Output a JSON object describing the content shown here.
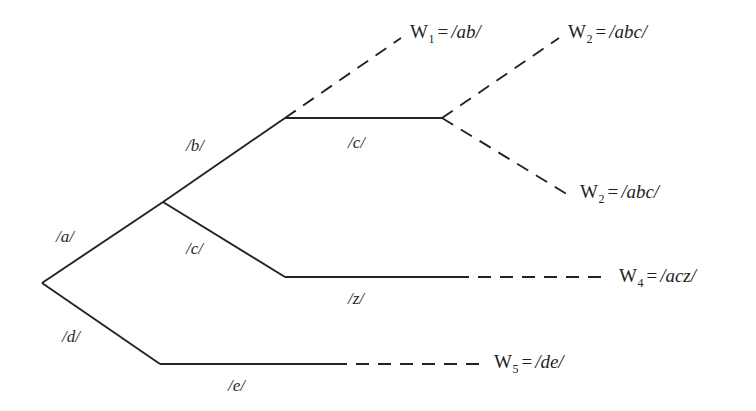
{
  "diagram": {
    "type": "phoneme-branching-tree",
    "background_color": "#ffffff",
    "line_color": "#232323",
    "solid_style": "solid",
    "terminal_style": "dashed",
    "nodes": {
      "root": {
        "x": 42,
        "y": 283
      },
      "upper_branch": {
        "x": 163,
        "y": 202
      },
      "b_node": {
        "x": 285,
        "y": 118
      },
      "c_fork": {
        "x": 442,
        "y": 118
      },
      "z_node": {
        "x": 285,
        "y": 277
      },
      "d_node": {
        "x": 160,
        "y": 364
      }
    },
    "edges": [
      {
        "id": "edge-a",
        "label": "/a/",
        "from": "root",
        "to": "upper_branch",
        "style": "solid"
      },
      {
        "id": "edge-d",
        "label": "/d/",
        "from": "root",
        "to": "d_node",
        "style": "solid"
      },
      {
        "id": "edge-b",
        "label": "/b/",
        "from": "upper_branch",
        "to": "b_node",
        "style": "solid"
      },
      {
        "id": "edge-c-upper",
        "label": "/c/",
        "from": "b_node",
        "to": "c_fork",
        "style": "solid"
      },
      {
        "id": "edge-c-lower",
        "label": "/c/",
        "from": "upper_branch",
        "to": "z_node",
        "style": "solid"
      },
      {
        "id": "edge-z",
        "label": "/z/",
        "from": "z_node",
        "to": "w4",
        "style": "solid-then-dashed"
      },
      {
        "id": "edge-e",
        "label": "/e/",
        "from": "d_node",
        "to": "w5",
        "style": "solid-then-dashed"
      },
      {
        "id": "edge-w1",
        "label": "",
        "from": "b_node",
        "to": "w1",
        "style": "dashed"
      },
      {
        "id": "edge-w2-upper",
        "label": "",
        "from": "c_fork",
        "to": "w2_upper",
        "style": "dashed"
      },
      {
        "id": "edge-w2-lower",
        "label": "",
        "from": "c_fork",
        "to": "w2_lower",
        "style": "dashed"
      }
    ],
    "phoneme_labels": [
      {
        "id": "label-a",
        "text": "/a/",
        "x": 56,
        "y": 228
      },
      {
        "id": "label-b",
        "text": "/b/",
        "x": 186,
        "y": 137
      },
      {
        "id": "label-c-upper",
        "text": "/c/",
        "x": 348,
        "y": 134
      },
      {
        "id": "label-c-lower",
        "text": "/c/",
        "x": 186,
        "y": 240
      },
      {
        "id": "label-z",
        "text": "/z/",
        "x": 348,
        "y": 290
      },
      {
        "id": "label-d",
        "text": "/d/",
        "x": 62,
        "y": 328
      },
      {
        "id": "label-e",
        "text": "/e/",
        "x": 228,
        "y": 377
      }
    ],
    "word_labels": [
      {
        "id": "word-w1",
        "symbol": "W",
        "subscript": "1",
        "equals": "=",
        "form": "/ab/",
        "full_text": "W1 = /ab/",
        "x": 410,
        "y": 22
      },
      {
        "id": "word-w2-upper",
        "symbol": "W",
        "subscript": "2",
        "equals": "=",
        "form": "/abc/",
        "full_text": "W2 = /abc/",
        "x": 568,
        "y": 22
      },
      {
        "id": "word-w2-lower",
        "symbol": "W",
        "subscript": "2",
        "equals": "=",
        "form": "/abc/",
        "full_text": "W2 = /abc/",
        "x": 580,
        "y": 182
      },
      {
        "id": "word-w4",
        "symbol": "W",
        "subscript": "4",
        "equals": "=",
        "form": "/acz/",
        "full_text": "W4 = /acz/",
        "x": 619,
        "y": 266
      },
      {
        "id": "word-w5",
        "symbol": "W",
        "subscript": "5",
        "equals": "=",
        "form": "/de/",
        "full_text": "W5 = /de/",
        "x": 494,
        "y": 352
      }
    ]
  }
}
